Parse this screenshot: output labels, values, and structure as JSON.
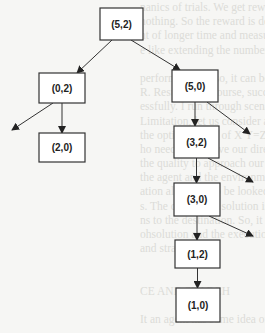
{
  "diagram": {
    "title": "",
    "nodes": [
      {
        "id": "n52",
        "label": "(5,2)"
      },
      {
        "id": "n02",
        "label": "(0,2)"
      },
      {
        "id": "n50",
        "label": "(5,0)"
      },
      {
        "id": "n20",
        "label": "(2,0)"
      },
      {
        "id": "n32",
        "label": "(3,2)"
      },
      {
        "id": "n30",
        "label": "(3,0)"
      },
      {
        "id": "n12",
        "label": "(1,2)"
      },
      {
        "id": "n10",
        "label": "(1,0)"
      }
    ],
    "edges": [
      {
        "from": "n52",
        "to": "n02"
      },
      {
        "from": "n52",
        "to": "n50"
      },
      {
        "from": "n02",
        "to": "n20"
      },
      {
        "from": "n02",
        "to": null,
        "note": "unlabeled branch"
      },
      {
        "from": "n50",
        "to": "n32"
      },
      {
        "from": "n50",
        "to": null,
        "note": "unlabeled branch"
      },
      {
        "from": "n32",
        "to": "n30"
      },
      {
        "from": "n32",
        "to": null,
        "note": "unlabeled branch"
      },
      {
        "from": "n30",
        "to": "n12"
      },
      {
        "from": "n30",
        "to": null,
        "note": "unlabeled branch"
      },
      {
        "from": "n12",
        "to": "n10"
      }
    ]
  },
  "bleed_through_text": [
    "nanics of trials. We get rewards when (reac",
    "nothing. So the reward is dependent on the",
    "nt of longer time and measures will make th",
    "e like extending the number",
    "",
    "performance. Also, it can be measured by intr",
    "R. Result is, of course, success or failure; beca",
    "essfully. I run through scenarios agreeably; m",
    "Limitation, let us consider an intelligent syst",
    "the optimal route of X Y=Z, if an environme",
    "ho need to improve our directions, we improve",
    "the quality to approach our preferred solution. T",
    "the agent and the environment in turn. The final",
    "ation also need to be looked at. We may well",
    "s. The cost of the solution is measured in term",
    "ns to the destination. So, it may be the same",
    "ohsolution and the execution time. One thing i",
    "and strategy.",
    "",
    "",
    "CE AND SEARCH",
    "",
    "It an agent has some idea of the environment and ha"
  ]
}
